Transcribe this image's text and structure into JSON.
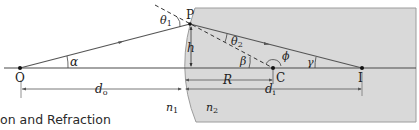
{
  "diagram": {
    "points": {
      "O": "O",
      "P": "P",
      "C": "C",
      "I": "I"
    },
    "angles": {
      "alpha": "α",
      "theta1": "θ",
      "theta1_sub": "1",
      "theta2": "θ",
      "theta2_sub": "2",
      "beta": "β",
      "gamma": "γ",
      "phi": "ϕ"
    },
    "lengths": {
      "h": "h",
      "R": "R",
      "d_o": "d",
      "d_o_sub": "o",
      "d_i": "d",
      "d_i_sub": "i"
    },
    "media": {
      "n1": "n",
      "n1_sub": "1",
      "n2": "n",
      "n2_sub": "2"
    },
    "colors": {
      "medium2_fill": "#d6d6d6",
      "medium2_edge": "#9a9a9a",
      "ray": "#5a5a5a",
      "axis": "#444444"
    }
  },
  "caption": {
    "text": "on and Refraction"
  }
}
